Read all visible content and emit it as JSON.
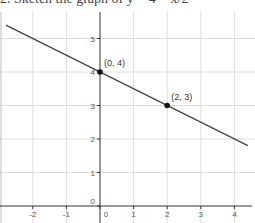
{
  "header": {
    "cut_text": "2.   Sketch the graph of y = 4 − x/2"
  },
  "chart_data": {
    "type": "line",
    "title": "",
    "xlabel": "",
    "ylabel": "",
    "xlim": [
      -2.9,
      4.4
    ],
    "ylim": [
      -0.3,
      5.8
    ],
    "grid": true,
    "x_ticks": [
      -2,
      -1,
      0,
      1,
      2,
      3,
      4
    ],
    "y_ticks": [
      0,
      1,
      2,
      3,
      4,
      5
    ],
    "x_tick_labels": [
      "-2",
      "-1",
      "0",
      "1",
      "2",
      "3",
      "4"
    ],
    "y_tick_labels": [
      "0",
      "1",
      "2",
      "3",
      "4",
      "5"
    ],
    "series": [
      {
        "name": "y = 4 - x/2",
        "slope": -0.5,
        "intercept": 4,
        "x": [
          -2.8,
          4.4
        ],
        "y": [
          5.4,
          1.8
        ]
      }
    ],
    "points": [
      {
        "x": 0,
        "y": 4,
        "label": "(0, 4)"
      },
      {
        "x": 2,
        "y": 3,
        "label": "(2, 3)"
      }
    ],
    "colors": {
      "line": "#444444",
      "grid": "#dddddd",
      "axis": "#333333",
      "point": "#111111"
    }
  }
}
